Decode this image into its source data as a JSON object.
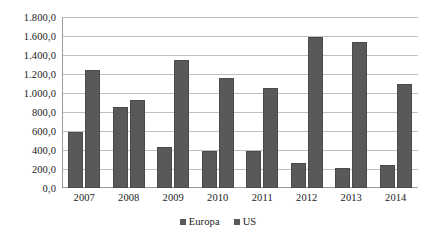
{
  "chart_data": {
    "type": "bar",
    "title": "",
    "xlabel": "",
    "ylabel": "",
    "categories": [
      "2007",
      "2008",
      "2009",
      "2010",
      "2011",
      "2012",
      "2013",
      "2014"
    ],
    "series": [
      {
        "name": "Europa",
        "values": [
          590,
          850,
          430,
          385,
          385,
          265,
          215,
          240
        ]
      },
      {
        "name": "US",
        "values": [
          1240,
          930,
          1350,
          1160,
          1050,
          1590,
          1540,
          1100
        ]
      }
    ],
    "ylim": [
      0,
      1800
    ],
    "ytick_values": [
      0,
      200,
      400,
      600,
      800,
      1000,
      1200,
      1400,
      1600,
      1800
    ],
    "ytick_labels": [
      "0,0",
      "200,0",
      "400,0",
      "600,0",
      "800,0",
      "1.000,0",
      "1.200,0",
      "1.400,0",
      "1.600,0",
      "1.800,0"
    ],
    "grid": "horizontal",
    "legend_position": "bottom",
    "bar_color": "#595959",
    "gridline_color": "#bfbfbf",
    "axis_color": "#9a9a9a",
    "text_color": "#1a1a1a"
  }
}
